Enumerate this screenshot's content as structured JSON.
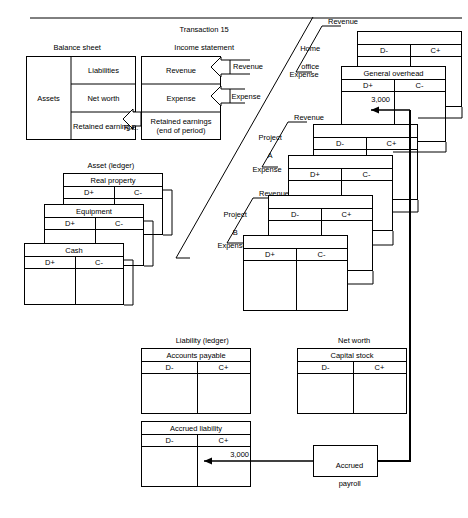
{
  "diagram": {
    "stroke_color": "#000000",
    "background": "#ffffff"
  },
  "balance_sheet": {
    "caption_line1": "Balance sheet",
    "caption_line2": "(31 Dec 19X1)",
    "left_cell": "Assets",
    "right_cells": [
      "Liabilities",
      "Net worth",
      "Retained\nearnings"
    ]
  },
  "income_statement": {
    "caption_line1": "Transaction 15",
    "caption_line2": "Income statement",
    "caption_line3": "(4th qtr 19X1)",
    "rows": [
      "Revenue",
      "Expense",
      "Retained earnings\n(end of period)"
    ]
  },
  "re_link_label": "R.E.",
  "flow_labels": {
    "revenue": "Revenue",
    "expense": "Expense"
  },
  "segments": [
    {
      "name": "home-office",
      "line1": "Home",
      "line2": "office",
      "revenue": "Revenue",
      "expense": "Expense"
    },
    {
      "name": "project-a",
      "line1": "Project",
      "line2": "A",
      "revenue": "Revenue",
      "expense": "Expense"
    },
    {
      "name": "project-b",
      "line1": "Project",
      "line2": "B",
      "revenue": "Revenue",
      "expense": "Expense"
    }
  ],
  "asset_accounts": {
    "caption_line1": "Asset (ledger)",
    "caption_line2": "accounts",
    "accounts": [
      {
        "title": "Real property",
        "debit": "D+",
        "credit": "C-",
        "amount": ""
      },
      {
        "title": "Equipment",
        "debit": "D+",
        "credit": "C-",
        "amount": ""
      },
      {
        "title": "Cash",
        "debit": "D+",
        "credit": "C-",
        "amount": ""
      }
    ]
  },
  "liability_accounts": {
    "caption_line1": "Liability (ledger)",
    "caption_line2": "accounts",
    "accounts": [
      {
        "title": "Accounts payable",
        "debit": "D-",
        "credit": "C+",
        "amount": ""
      },
      {
        "title": "Accrued liability",
        "debit": "D-",
        "credit": "C+",
        "amount": "3,000"
      }
    ]
  },
  "net_worth_accounts": {
    "caption_line1": "Net worth",
    "caption_line2": "accounts",
    "accounts": [
      {
        "title": "Capital stock",
        "debit": "D-",
        "credit": "C+",
        "amount": ""
      }
    ]
  },
  "revenue_expense_accounts": [
    {
      "title": "",
      "debit": "D-",
      "credit": "C+",
      "amount": ""
    },
    {
      "title": "General overhead",
      "debit": "D+",
      "credit": "C-",
      "amount": "3,000"
    },
    {
      "title": "",
      "debit": "D-",
      "credit": "C+",
      "amount": ""
    },
    {
      "title": "",
      "debit": "D+",
      "credit": "C-",
      "amount": ""
    },
    {
      "title": "",
      "debit": "D-",
      "credit": "C+",
      "amount": ""
    },
    {
      "title": "",
      "debit": "D+",
      "credit": "C-",
      "amount": ""
    }
  ],
  "accrued_payroll": {
    "line1": "Accrued",
    "line2": "payroll"
  }
}
